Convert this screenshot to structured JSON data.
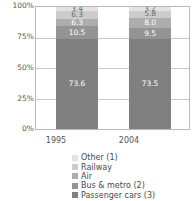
{
  "chart_data": {
    "type": "bar",
    "stacked": true,
    "normalized": "100%",
    "title": "",
    "subtitle": "",
    "xlabel": "",
    "ylabel": "",
    "categories": [
      "1995",
      "2004"
    ],
    "ylim": [
      0,
      100
    ],
    "ytick_labels": [
      "100%",
      "75%",
      "50%",
      "25%",
      "0%"
    ],
    "ytick_values": [
      100,
      75,
      50,
      25,
      0
    ],
    "grid": true,
    "legend_position": "bottom",
    "series": [
      {
        "name": "Other (1)",
        "values": [
          3.4,
          3.2
        ],
        "color": "#e2e2e2"
      },
      {
        "name": "Railway",
        "values": [
          6.3,
          5.8
        ],
        "color": "#cccccc"
      },
      {
        "name": "Air",
        "values": [
          6.3,
          8.0
        ],
        "color": "#adadad"
      },
      {
        "name": "Bus &  metro (2)",
        "values": [
          10.5,
          9.5
        ],
        "color": "#949494"
      },
      {
        "name": "Passenger cars (3)",
        "values": [
          73.6,
          73.5
        ],
        "color": "#808080"
      }
    ],
    "data_labels": {
      "1995": [
        "3.4",
        "6.3",
        "6.3",
        "10.5",
        "73.6"
      ],
      "2004": [
        "3.2",
        "5.8",
        "8.0",
        "9.5",
        "73.5"
      ]
    }
  },
  "legend": {
    "items": [
      {
        "label": "Other (1)"
      },
      {
        "label": "Railway"
      },
      {
        "label": "Air"
      },
      {
        "label": "Bus &  metro (2)"
      },
      {
        "label": "Passenger cars (3)"
      }
    ]
  },
  "axis": {
    "y_ticks": [
      "100%",
      "75%",
      "50%",
      "25%",
      "0%"
    ],
    "x_ticks": [
      "1995",
      "2004"
    ]
  }
}
